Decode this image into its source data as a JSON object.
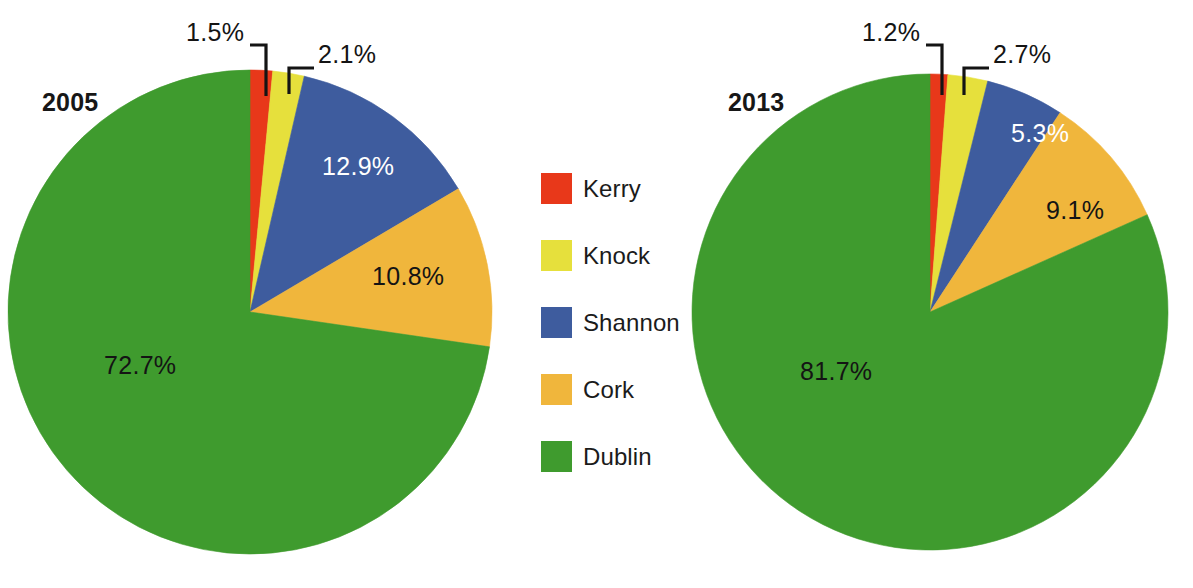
{
  "figure": {
    "background_color": "#ffffff"
  },
  "legend": {
    "position": "center",
    "items": [
      {
        "label": "Kerry",
        "color": "#e8381a"
      },
      {
        "label": "Knock",
        "color": "#e6e03c"
      },
      {
        "label": "Shannon",
        "color": "#3e5c9e"
      },
      {
        "label": "Cork",
        "color": "#f0b63c"
      },
      {
        "label": "Dublin",
        "color": "#3f9b2e"
      }
    ]
  },
  "charts": [
    {
      "id": "chart-2005",
      "year_label": "2005",
      "labels": {
        "kerry": "1.5%",
        "knock": "2.1%",
        "shannon": "12.9%",
        "cork": "10.8%",
        "dublin": "72.7%"
      }
    },
    {
      "id": "chart-2013",
      "year_label": "2013",
      "labels": {
        "kerry": "1.2%",
        "knock": "2.7%",
        "shannon": "5.3%",
        "cork": "9.1%",
        "dublin": "81.7%"
      }
    }
  ],
  "chart_data": [
    {
      "type": "pie",
      "title": "2005",
      "categories": [
        "Kerry",
        "Knock",
        "Shannon",
        "Cork",
        "Dublin"
      ],
      "values": [
        1.5,
        2.1,
        12.9,
        10.8,
        72.7
      ],
      "value_labels": [
        "1.5%",
        "2.1%",
        "12.9%",
        "10.8%",
        "72.7%"
      ],
      "colors": [
        "#e8381a",
        "#e6e03c",
        "#3e5c9e",
        "#f0b63c",
        "#3f9b2e"
      ],
      "units": "percent",
      "start_angle_deg": 0,
      "direction": "clockwise",
      "legend": "shared-center",
      "label_placement": [
        "callout",
        "callout",
        "inside",
        "inside",
        "inside"
      ]
    },
    {
      "type": "pie",
      "title": "2013",
      "categories": [
        "Kerry",
        "Knock",
        "Shannon",
        "Cork",
        "Dublin"
      ],
      "values": [
        1.2,
        2.7,
        5.3,
        9.1,
        81.7
      ],
      "value_labels": [
        "1.2%",
        "2.7%",
        "5.3%",
        "9.1%",
        "81.7%"
      ],
      "colors": [
        "#e8381a",
        "#e6e03c",
        "#3e5c9e",
        "#f0b63c",
        "#3f9b2e"
      ],
      "units": "percent",
      "start_angle_deg": 0,
      "direction": "clockwise",
      "legend": "shared-center",
      "label_placement": [
        "callout",
        "callout",
        "inside",
        "inside",
        "inside"
      ]
    }
  ]
}
